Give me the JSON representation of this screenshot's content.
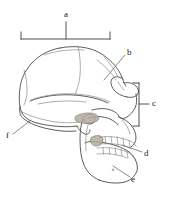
{
  "figure": {
    "background_color": "#ffffff",
    "outline_color": "#4a4a4a",
    "detail_color": "#8a8a8a",
    "shade_color": "#9b9289",
    "label_color": "#1a1a1a",
    "leader_color": "#6b6b6b",
    "width": 174,
    "height": 199
  },
  "labels": [
    {
      "id": "a",
      "text": "a",
      "marker": "bracket-horizontal",
      "x": 64,
      "y": 10,
      "target": "cranial-vault"
    },
    {
      "id": "b",
      "text": "b",
      "marker": "leader-line",
      "x": 127,
      "y": 48,
      "target": "frontal-supraorbital-region"
    },
    {
      "id": "c",
      "text": "c",
      "marker": "bracket-vertical",
      "x": 152,
      "y": 97,
      "target": "facial-skeleton-orbit-to-maxilla"
    },
    {
      "id": "d",
      "text": "d",
      "marker": "leader-line",
      "x": 144,
      "y": 150,
      "target": "dentition-teeth-row"
    },
    {
      "id": "e",
      "text": "e",
      "marker": "leader-line",
      "x": 131,
      "y": 175,
      "target": "mandible-gonial-angle"
    },
    {
      "id": "f",
      "text": "f",
      "marker": "leader-line",
      "x": 6,
      "y": 133,
      "target": "occipital-nuchal-region"
    }
  ],
  "brackets": {
    "a": {
      "orientation": "horizontal",
      "x1": 21,
      "x2": 110,
      "y": 39,
      "tick_height": 7,
      "stem_x": 68,
      "stem_top": 22
    },
    "c": {
      "orientation": "vertical",
      "y1": 83,
      "y2": 126,
      "x": 139,
      "tick_width": 6,
      "stem_y": 104,
      "stem_right": 149
    }
  },
  "leaders": [
    {
      "id": "b",
      "x1": 125,
      "y1": 55,
      "x2": 104,
      "y2": 80
    },
    {
      "id": "d",
      "x1": 142,
      "y1": 152,
      "x2": 122,
      "y2": 145
    },
    {
      "id": "e",
      "x1": 130,
      "y1": 177,
      "x2": 113,
      "y2": 166
    },
    {
      "id": "f",
      "x1": 13,
      "y1": 134,
      "x2": 31,
      "y2": 120
    }
  ],
  "anatomy_parts": [
    {
      "name": "cranial-vault"
    },
    {
      "name": "frontal-bone"
    },
    {
      "name": "parietal-bone"
    },
    {
      "name": "occipital-bone"
    },
    {
      "name": "temporal-bone"
    },
    {
      "name": "zygomatic-arch"
    },
    {
      "name": "orbit"
    },
    {
      "name": "nasal-aperture"
    },
    {
      "name": "maxilla"
    },
    {
      "name": "mandible"
    },
    {
      "name": "upper-teeth-row"
    },
    {
      "name": "lower-teeth-row"
    },
    {
      "name": "external-auditory-meatus"
    },
    {
      "name": "coronal-suture"
    },
    {
      "name": "lambdoid-suture"
    }
  ]
}
